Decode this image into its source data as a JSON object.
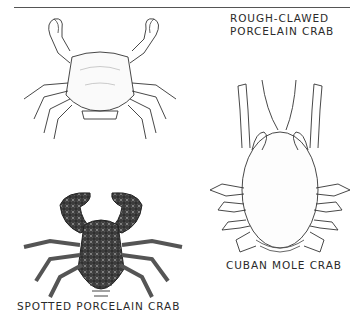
{
  "page": {
    "header_rule": true
  },
  "figures": [
    {
      "id": "rough-clawed",
      "label_lines": [
        "ROUGH-CLAWED",
        "PORCELAIN CRAB"
      ]
    },
    {
      "id": "cuban-mole",
      "label_lines": [
        "CUBAN MOLE CRAB"
      ]
    },
    {
      "id": "spotted-porcelain",
      "label_lines": [
        "SPOTTED PORCELAIN CRAB"
      ]
    }
  ]
}
